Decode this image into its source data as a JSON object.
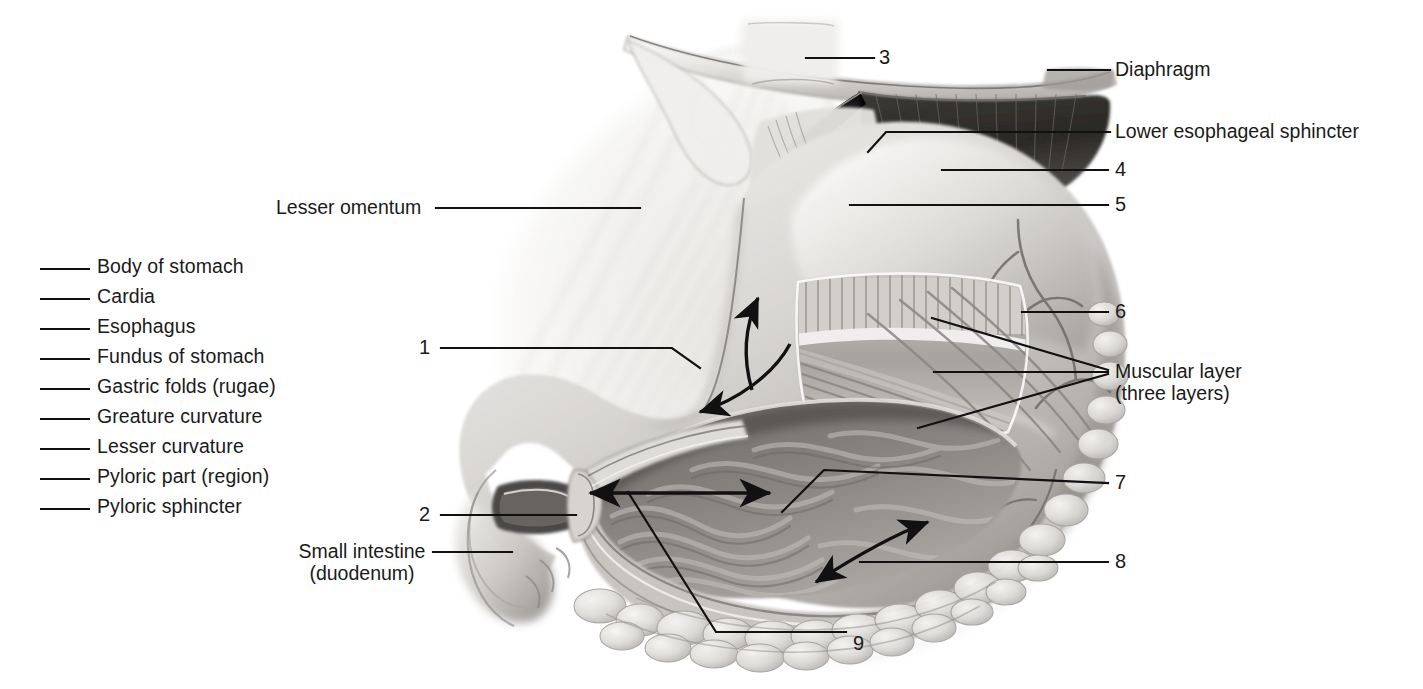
{
  "figure": {
    "background_color": "#ffffff",
    "ink_color": "#1a1a1a"
  },
  "answer_list": {
    "name": "word-bank-with-blanks",
    "items": [
      {
        "label": "Body of stomach"
      },
      {
        "label": "Cardia"
      },
      {
        "label": "Esophagus"
      },
      {
        "label": "Fundus of stomach"
      },
      {
        "label": "Gastric folds (rugae)"
      },
      {
        "label": "Greature curvature"
      },
      {
        "label": "Lesser curvature"
      },
      {
        "label": "Pyloric part (region)"
      },
      {
        "label": "Pyloric sphincter"
      }
    ]
  },
  "callouts": {
    "lesser_omentum": "Lesser omentum",
    "small_intestine_line1": "Small intestine",
    "small_intestine_line2": "(duodenum)",
    "diaphragm": "Diaphragm",
    "lower_esophageal_sphincter": "Lower esophageal sphincter",
    "muscular_layer_line1": "Muscular layer",
    "muscular_layer_line2": "(three layers)",
    "n1": "1",
    "n2": "2",
    "n3": "3",
    "n4": "4",
    "n5": "5",
    "n6": "6",
    "n7": "7",
    "n8": "8",
    "n9": "9"
  }
}
